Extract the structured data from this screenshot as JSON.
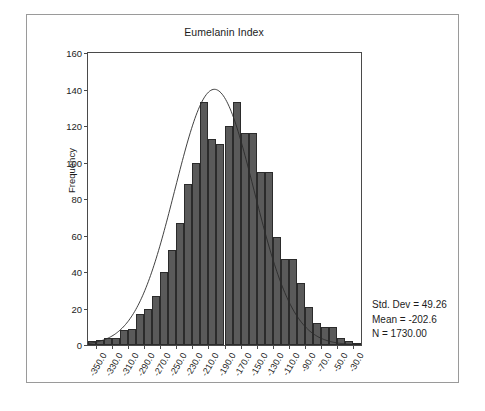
{
  "chart_data": {
    "type": "bar",
    "title": "Eumelanin Index",
    "xlabel": "",
    "ylabel": "Frequency",
    "ylim": [
      0,
      160
    ],
    "yticks": [
      0,
      20,
      40,
      60,
      80,
      100,
      120,
      140,
      160
    ],
    "grid": false,
    "legend": null,
    "bin_width": 10,
    "xtick_labels": [
      "-350.0",
      "-330.0",
      "-310.0",
      "-290.0",
      "-270.0",
      "-250.0",
      "-230.0",
      "-210.0",
      "-190.0",
      "-170.0",
      "-150.0",
      "-130.0",
      "-110.0",
      "-90.0",
      "-70.0",
      "-50.0",
      "-30.0"
    ],
    "xtick_values": [
      -350,
      -330,
      -310,
      -290,
      -270,
      -250,
      -230,
      -210,
      -190,
      -170,
      -150,
      -130,
      -110,
      -90,
      -70,
      -50,
      -30
    ],
    "xlim": [
      -360,
      -20
    ],
    "categories": [
      -355,
      -345,
      -335,
      -325,
      -315,
      -305,
      -295,
      -285,
      -275,
      -265,
      -255,
      -245,
      -235,
      -225,
      -215,
      -205,
      -195,
      -185,
      -175,
      -165,
      -155,
      -145,
      -135,
      -125,
      -115,
      -105,
      -95,
      -85,
      -75,
      -65,
      -55,
      -45,
      -35,
      -25
    ],
    "values": [
      2,
      3,
      4,
      4,
      8,
      9,
      17,
      20,
      27,
      40,
      52,
      67,
      88,
      100,
      133,
      113,
      110,
      120,
      133,
      116,
      116,
      95,
      95,
      59,
      47,
      47,
      34,
      21,
      12,
      10,
      10,
      4,
      2,
      1
    ],
    "overlay": {
      "type": "normal-curve",
      "mean": -202.6,
      "std_dev": 49.26,
      "n": 1730
    },
    "annotations": {
      "std_dev": "Std. Dev = 49.26",
      "mean": "Mean = -202.6",
      "n": "N = 1730.00"
    },
    "colors": {
      "bar_fill": "#5a5a5a",
      "bar_edge": "#2b2b2b",
      "axis": "#4a4a4a",
      "curve": "#2b2b2b",
      "frame": "#9a9a9a",
      "background": "#ffffff",
      "text": "#1c1c1c"
    }
  },
  "stats": {
    "std_dev_label": "Std. Dev = 49.26",
    "mean_label": "Mean = -202.6",
    "n_label": "N = 1730.00"
  }
}
